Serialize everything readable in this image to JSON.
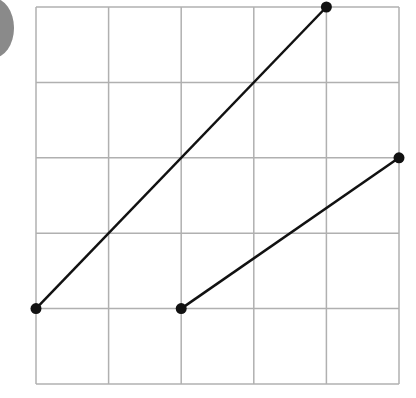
{
  "badge": {
    "shape": "circle",
    "color": "#8a8a8a"
  },
  "grid": {
    "columns": 5,
    "rows": 5,
    "line_color": "#b0b0b0",
    "origin_px": [
      36,
      384
    ],
    "cell_px": [
      72.6,
      75.4
    ]
  },
  "chart_data": {
    "type": "line",
    "title": "",
    "xlabel": "",
    "ylabel": "",
    "xlim": [
      0,
      5
    ],
    "ylim": [
      0,
      5
    ],
    "grid": true,
    "series": [
      {
        "name": "segment-1",
        "points": [
          [
            0,
            1
          ],
          [
            4,
            5
          ]
        ],
        "color": "#111111"
      },
      {
        "name": "segment-2",
        "points": [
          [
            2,
            1
          ],
          [
            5,
            3
          ]
        ],
        "color": "#111111"
      }
    ]
  }
}
